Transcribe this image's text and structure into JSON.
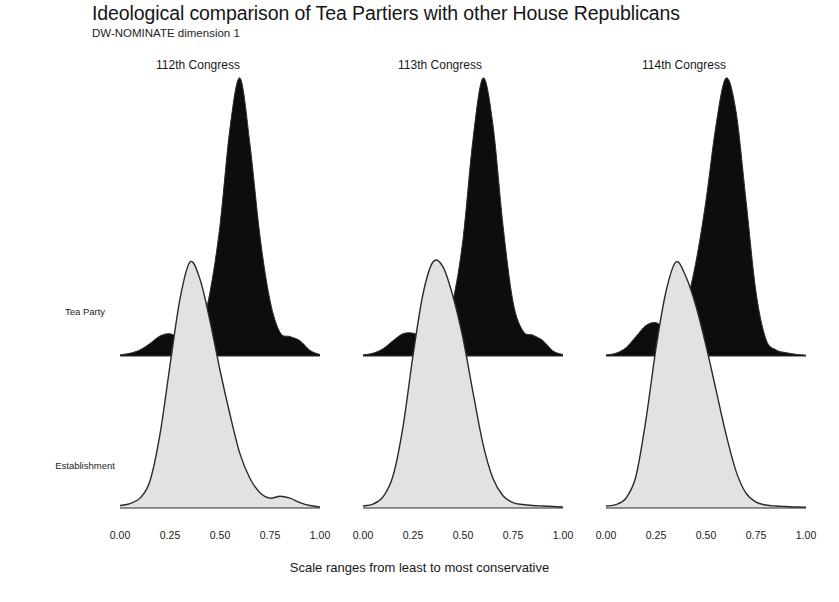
{
  "header": {
    "title": "Ideological comparison of Tea Partiers with other House Republicans",
    "subtitle": "DW-NOMINATE dimension 1"
  },
  "caption": "Scale ranges from least to most conservative",
  "row_labels": [
    "Tea Party",
    "Establishment"
  ],
  "colors": {
    "tea_party_fill": "#0d0d0d",
    "establishment_fill": "#e2e2e2",
    "outline": "#2b2b2b",
    "text": "#191919",
    "background": "#ffffff"
  },
  "panels": [
    {
      "title": "112th Congress",
      "tick_labels": [
        "0.00",
        "0.25",
        "0.50",
        "0.75",
        "1.00"
      ]
    },
    {
      "title": "113th Congress",
      "tick_labels": [
        "0.00",
        "0.25",
        "0.50",
        "0.75",
        "1.00"
      ]
    },
    {
      "title": "114th Congress",
      "tick_labels": [
        "0.00",
        "0.25",
        "0.50",
        "0.75",
        "1.00"
      ]
    }
  ],
  "chart_data": {
    "type": "area",
    "title": "Ideological comparison of Tea Partiers with other House Republicans",
    "subtitle": "DW-NOMINATE dimension 1",
    "xlabel": "Scale ranges from least to most conservative",
    "ylabel": "",
    "xlim": [
      0.0,
      1.0
    ],
    "xticks": [
      0.0,
      0.25,
      0.5,
      0.75,
      1.0
    ],
    "xtick_labels": [
      "0.00",
      "0.25",
      "0.50",
      "0.75",
      "1.00"
    ],
    "grid": false,
    "legend_position": "none",
    "facet_titles": [
      "112th Congress",
      "113th Congress",
      "114th Congress"
    ],
    "group_labels": [
      "Tea Party",
      "Establishment"
    ],
    "note": "Ridgeline / joyplot: kernel density of DW-NOMINATE dimension 1 scores. Densities normalised so each curve peak is reported as a fraction of that row's maximum drawn height.",
    "series": [
      {
        "facet": "112th Congress",
        "group": "Tea Party",
        "fill": "#0d0d0d",
        "peak_x": 0.595,
        "density": [
          {
            "x": 0.0,
            "y": 0.004
          },
          {
            "x": 0.05,
            "y": 0.01
          },
          {
            "x": 0.1,
            "y": 0.022
          },
          {
            "x": 0.15,
            "y": 0.045
          },
          {
            "x": 0.2,
            "y": 0.072
          },
          {
            "x": 0.25,
            "y": 0.08
          },
          {
            "x": 0.3,
            "y": 0.062
          },
          {
            "x": 0.35,
            "y": 0.045
          },
          {
            "x": 0.4,
            "y": 0.09
          },
          {
            "x": 0.45,
            "y": 0.23
          },
          {
            "x": 0.5,
            "y": 0.47
          },
          {
            "x": 0.55,
            "y": 0.82
          },
          {
            "x": 0.6,
            "y": 1.0
          },
          {
            "x": 0.65,
            "y": 0.76
          },
          {
            "x": 0.7,
            "y": 0.43
          },
          {
            "x": 0.75,
            "y": 0.2
          },
          {
            "x": 0.8,
            "y": 0.085
          },
          {
            "x": 0.85,
            "y": 0.07
          },
          {
            "x": 0.9,
            "y": 0.055
          },
          {
            "x": 0.95,
            "y": 0.02
          },
          {
            "x": 1.0,
            "y": 0.005
          }
        ]
      },
      {
        "facet": "112th Congress",
        "group": "Establishment",
        "fill": "#e2e2e2",
        "peak_x": 0.355,
        "density": [
          {
            "x": 0.0,
            "y": 0.01
          },
          {
            "x": 0.05,
            "y": 0.018
          },
          {
            "x": 0.1,
            "y": 0.04
          },
          {
            "x": 0.15,
            "y": 0.11
          },
          {
            "x": 0.2,
            "y": 0.3
          },
          {
            "x": 0.25,
            "y": 0.58
          },
          {
            "x": 0.3,
            "y": 0.85
          },
          {
            "x": 0.35,
            "y": 1.0
          },
          {
            "x": 0.4,
            "y": 0.93
          },
          {
            "x": 0.45,
            "y": 0.76
          },
          {
            "x": 0.5,
            "y": 0.56
          },
          {
            "x": 0.55,
            "y": 0.38
          },
          {
            "x": 0.6,
            "y": 0.22
          },
          {
            "x": 0.65,
            "y": 0.12
          },
          {
            "x": 0.7,
            "y": 0.062
          },
          {
            "x": 0.75,
            "y": 0.04
          },
          {
            "x": 0.8,
            "y": 0.048
          },
          {
            "x": 0.85,
            "y": 0.04
          },
          {
            "x": 0.9,
            "y": 0.022
          },
          {
            "x": 0.95,
            "y": 0.01
          },
          {
            "x": 1.0,
            "y": 0.004
          }
        ]
      },
      {
        "facet": "113th Congress",
        "group": "Tea Party",
        "fill": "#0d0d0d",
        "peak_x": 0.61,
        "density": [
          {
            "x": 0.0,
            "y": 0.004
          },
          {
            "x": 0.05,
            "y": 0.01
          },
          {
            "x": 0.1,
            "y": 0.026
          },
          {
            "x": 0.15,
            "y": 0.055
          },
          {
            "x": 0.2,
            "y": 0.08
          },
          {
            "x": 0.25,
            "y": 0.082
          },
          {
            "x": 0.3,
            "y": 0.068
          },
          {
            "x": 0.35,
            "y": 0.06
          },
          {
            "x": 0.4,
            "y": 0.095
          },
          {
            "x": 0.45,
            "y": 0.2
          },
          {
            "x": 0.5,
            "y": 0.42
          },
          {
            "x": 0.55,
            "y": 0.78
          },
          {
            "x": 0.6,
            "y": 1.0
          },
          {
            "x": 0.65,
            "y": 0.83
          },
          {
            "x": 0.7,
            "y": 0.47
          },
          {
            "x": 0.75,
            "y": 0.195
          },
          {
            "x": 0.8,
            "y": 0.09
          },
          {
            "x": 0.85,
            "y": 0.075
          },
          {
            "x": 0.9,
            "y": 0.055
          },
          {
            "x": 0.95,
            "y": 0.018
          },
          {
            "x": 1.0,
            "y": 0.005
          }
        ]
      },
      {
        "facet": "113th Congress",
        "group": "Establishment",
        "fill": "#e2e2e2",
        "peak_x": 0.37,
        "density": [
          {
            "x": 0.0,
            "y": 0.008
          },
          {
            "x": 0.05,
            "y": 0.016
          },
          {
            "x": 0.1,
            "y": 0.045
          },
          {
            "x": 0.15,
            "y": 0.13
          },
          {
            "x": 0.2,
            "y": 0.33
          },
          {
            "x": 0.25,
            "y": 0.62
          },
          {
            "x": 0.3,
            "y": 0.87
          },
          {
            "x": 0.35,
            "y": 1.0
          },
          {
            "x": 0.4,
            "y": 0.98
          },
          {
            "x": 0.45,
            "y": 0.86
          },
          {
            "x": 0.5,
            "y": 0.69
          },
          {
            "x": 0.55,
            "y": 0.47
          },
          {
            "x": 0.6,
            "y": 0.26
          },
          {
            "x": 0.65,
            "y": 0.12
          },
          {
            "x": 0.7,
            "y": 0.05
          },
          {
            "x": 0.75,
            "y": 0.022
          },
          {
            "x": 0.8,
            "y": 0.014
          },
          {
            "x": 0.85,
            "y": 0.01
          },
          {
            "x": 0.9,
            "y": 0.008
          },
          {
            "x": 0.95,
            "y": 0.006
          },
          {
            "x": 1.0,
            "y": 0.004
          }
        ]
      },
      {
        "facet": "114th Congress",
        "group": "Tea Party",
        "fill": "#0d0d0d",
        "peak_x": 0.61,
        "density": [
          {
            "x": 0.0,
            "y": 0.004
          },
          {
            "x": 0.05,
            "y": 0.01
          },
          {
            "x": 0.1,
            "y": 0.03
          },
          {
            "x": 0.15,
            "y": 0.07
          },
          {
            "x": 0.2,
            "y": 0.11
          },
          {
            "x": 0.25,
            "y": 0.12
          },
          {
            "x": 0.3,
            "y": 0.098
          },
          {
            "x": 0.35,
            "y": 0.105
          },
          {
            "x": 0.4,
            "y": 0.185
          },
          {
            "x": 0.45,
            "y": 0.34
          },
          {
            "x": 0.5,
            "y": 0.56
          },
          {
            "x": 0.55,
            "y": 0.83
          },
          {
            "x": 0.6,
            "y": 1.0
          },
          {
            "x": 0.65,
            "y": 0.88
          },
          {
            "x": 0.7,
            "y": 0.56
          },
          {
            "x": 0.75,
            "y": 0.23
          },
          {
            "x": 0.8,
            "y": 0.06
          },
          {
            "x": 0.85,
            "y": 0.022
          },
          {
            "x": 0.9,
            "y": 0.012
          },
          {
            "x": 0.95,
            "y": 0.006
          },
          {
            "x": 1.0,
            "y": 0.003
          }
        ]
      },
      {
        "facet": "114th Congress",
        "group": "Establishment",
        "fill": "#e2e2e2",
        "peak_x": 0.355,
        "density": [
          {
            "x": 0.0,
            "y": 0.008
          },
          {
            "x": 0.05,
            "y": 0.014
          },
          {
            "x": 0.1,
            "y": 0.04
          },
          {
            "x": 0.15,
            "y": 0.13
          },
          {
            "x": 0.2,
            "y": 0.36
          },
          {
            "x": 0.25,
            "y": 0.65
          },
          {
            "x": 0.3,
            "y": 0.88
          },
          {
            "x": 0.35,
            "y": 1.0
          },
          {
            "x": 0.4,
            "y": 0.94
          },
          {
            "x": 0.45,
            "y": 0.82
          },
          {
            "x": 0.5,
            "y": 0.66
          },
          {
            "x": 0.55,
            "y": 0.48
          },
          {
            "x": 0.6,
            "y": 0.3
          },
          {
            "x": 0.65,
            "y": 0.15
          },
          {
            "x": 0.7,
            "y": 0.06
          },
          {
            "x": 0.75,
            "y": 0.024
          },
          {
            "x": 0.8,
            "y": 0.012
          },
          {
            "x": 0.85,
            "y": 0.008
          },
          {
            "x": 0.9,
            "y": 0.006
          },
          {
            "x": 0.95,
            "y": 0.004
          },
          {
            "x": 1.0,
            "y": 0.003
          }
        ]
      }
    ]
  }
}
